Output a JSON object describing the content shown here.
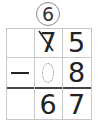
{
  "problem": {
    "type": "vertical-subtraction-with-borrowing",
    "carry_digit": "6",
    "rows": [
      {
        "sign": "",
        "tens": "7",
        "tens_struck": true,
        "ones": "5"
      },
      {
        "sign": "−",
        "tens": "",
        "tens_blank": true,
        "ones": "8"
      },
      {
        "sign": "",
        "tens": "6",
        "ones": "7"
      }
    ]
  },
  "colors": {
    "grid_line": "#c8c8c8",
    "result_separator": "#444444",
    "text": "#222222"
  }
}
